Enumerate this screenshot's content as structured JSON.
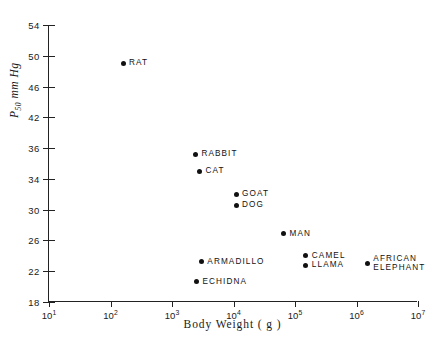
{
  "chart_data": {
    "type": "scatter",
    "title": "",
    "xlabel": "Body Weight ( g )",
    "ylabel_main": "P",
    "ylabel_sub": "50",
    "ylabel_unit": " mm Hg",
    "xscale": "log",
    "yscale": "linear",
    "xlim": [
      10,
      10000000
    ],
    "ylim": [
      18,
      54
    ],
    "grid": false,
    "legend": "none",
    "xticks": [
      {
        "value": 10,
        "mantissa": "10",
        "exponent": "1"
      },
      {
        "value": 100,
        "mantissa": "10",
        "exponent": "2"
      },
      {
        "value": 1000,
        "mantissa": "10",
        "exponent": "3"
      },
      {
        "value": 10000,
        "mantissa": "10",
        "exponent": "4"
      },
      {
        "value": 100000,
        "mantissa": "10",
        "exponent": "5"
      },
      {
        "value": 1000000,
        "mantissa": "10",
        "exponent": "6"
      },
      {
        "value": 10000000,
        "mantissa": "10",
        "exponent": "7"
      }
    ],
    "yticks": [
      {
        "value": 54,
        "label": "54"
      },
      {
        "value": 50,
        "label": "50"
      },
      {
        "value": 46,
        "label": "46"
      },
      {
        "value": 42,
        "label": "42"
      },
      {
        "value": 38,
        "label": "36"
      },
      {
        "value": 34,
        "label": "34"
      },
      {
        "value": 30,
        "label": "30"
      },
      {
        "value": 26,
        "label": "26"
      },
      {
        "value": 22,
        "label": "22"
      },
      {
        "value": 18,
        "label": "18"
      }
    ],
    "points": [
      {
        "label": "RAT",
        "x": 160,
        "y": 49.0,
        "label_pos": "right"
      },
      {
        "label": "RABBIT",
        "x": 2400,
        "y": 37.2,
        "label_pos": "right"
      },
      {
        "label": "CAT",
        "x": 2800,
        "y": 35.0,
        "label_pos": "right"
      },
      {
        "label": "GOAT",
        "x": 11000,
        "y": 32.0,
        "label_pos": "right"
      },
      {
        "label": "DOG",
        "x": 11000,
        "y": 30.6,
        "label_pos": "right"
      },
      {
        "label": "MAN",
        "x": 65000,
        "y": 26.9,
        "label_pos": "right"
      },
      {
        "label": "ARMADILLO",
        "x": 3000,
        "y": 23.2,
        "label_pos": "right"
      },
      {
        "label": "ECHIDNA",
        "x": 2500,
        "y": 20.6,
        "label_pos": "right"
      },
      {
        "label": "CAMEL",
        "x": 150000,
        "y": 24.0,
        "label_pos": "right"
      },
      {
        "label": "LLAMA",
        "x": 150000,
        "y": 22.8,
        "label_pos": "right"
      },
      {
        "label": "AFRICAN\nELEPHANT",
        "x": 1500000,
        "y": 23.0,
        "label_pos": "right"
      }
    ]
  },
  "axes": {
    "x_title": "Body Weight ( g )"
  }
}
